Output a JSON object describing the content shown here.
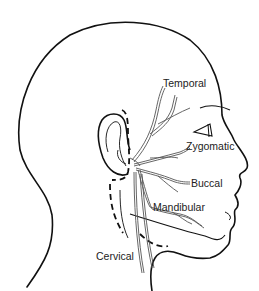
{
  "diagram": {
    "labels": [
      {
        "id": "temporal",
        "text": "Temporal"
      },
      {
        "id": "zygomatic",
        "text": "Zygomatic"
      },
      {
        "id": "buccal",
        "text": "Buccal"
      },
      {
        "id": "mandibular",
        "text": "Mandibular"
      },
      {
        "id": "cervical",
        "text": "Cervical"
      }
    ],
    "colors": {
      "outline": "#111111",
      "nerve": "#555555",
      "text": "#222222",
      "background": "#ffffff"
    }
  }
}
